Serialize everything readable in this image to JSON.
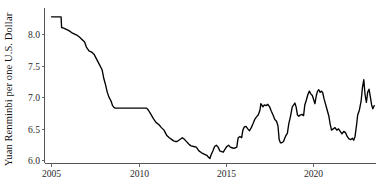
{
  "chart_data": {
    "type": "line",
    "title": "",
    "subtitle": "",
    "xlabel": "",
    "ylabel": "Yuan Renminbi per one U.S. Dollar",
    "legend": [],
    "legend_position": "none",
    "grid": false,
    "line_color": "#000000",
    "background_color": "#ffffff",
    "axis_color": "#555555",
    "xlim": [
      2004.6,
      2023.6
    ],
    "ylim": [
      5.95,
      8.42
    ],
    "xticks": [
      2005,
      2010,
      2015,
      2020
    ],
    "xticklabels": [
      "2005",
      "2010",
      "2015",
      "2020"
    ],
    "yticks": [
      6.0,
      6.5,
      7.0,
      7.5,
      8.0
    ],
    "yticklabels": [
      "6.0",
      "6.5",
      "7.0",
      "7.5",
      "8.0"
    ],
    "series": [
      {
        "name": "Yuan Renminbi per one U.S. Dollar",
        "x": [
          2005.0,
          2005.2,
          2005.4,
          2005.55,
          2005.58,
          2005.7,
          2005.85,
          2006.0,
          2006.15,
          2006.3,
          2006.45,
          2006.6,
          2006.75,
          2006.9,
          2007.0,
          2007.15,
          2007.3,
          2007.45,
          2007.6,
          2007.75,
          2007.9,
          2008.0,
          2008.1,
          2008.2,
          2008.3,
          2008.4,
          2008.5,
          2008.58,
          2008.65,
          2008.8,
          2009.0,
          2009.25,
          2009.5,
          2009.75,
          2010.0,
          2010.25,
          2010.45,
          2010.55,
          2010.7,
          2010.85,
          2011.0,
          2011.15,
          2011.3,
          2011.45,
          2011.6,
          2011.75,
          2011.9,
          2012.0,
          2012.1,
          2012.2,
          2012.3,
          2012.4,
          2012.5,
          2012.6,
          2012.7,
          2012.8,
          2012.9,
          2013.0,
          2013.15,
          2013.3,
          2013.45,
          2013.6,
          2013.75,
          2013.9,
          2014.0,
          2014.08,
          2014.15,
          2014.25,
          2014.35,
          2014.45,
          2014.55,
          2014.65,
          2014.75,
          2014.85,
          2014.95,
          2015.05,
          2015.15,
          2015.25,
          2015.35,
          2015.45,
          2015.55,
          2015.62,
          2015.7,
          2015.8,
          2015.9,
          2015.97,
          2016.05,
          2016.15,
          2016.25,
          2016.35,
          2016.45,
          2016.55,
          2016.65,
          2016.75,
          2016.85,
          2016.95,
          2017.0,
          2017.05,
          2017.12,
          2017.2,
          2017.3,
          2017.4,
          2017.5,
          2017.6,
          2017.7,
          2017.8,
          2017.9,
          2017.98,
          2018.05,
          2018.12,
          2018.2,
          2018.3,
          2018.38,
          2018.45,
          2018.52,
          2018.6,
          2018.7,
          2018.8,
          2018.88,
          2018.95,
          2019.02,
          2019.1,
          2019.18,
          2019.25,
          2019.35,
          2019.45,
          2019.52,
          2019.6,
          2019.7,
          2019.78,
          2019.85,
          2019.95,
          2020.02,
          2020.1,
          2020.18,
          2020.25,
          2020.32,
          2020.4,
          2020.48,
          2020.55,
          2020.62,
          2020.7,
          2020.8,
          2020.9,
          2020.97,
          2021.05,
          2021.15,
          2021.25,
          2021.35,
          2021.45,
          2021.55,
          2021.65,
          2021.75,
          2021.85,
          2021.95,
          2022.05,
          2022.15,
          2022.25,
          2022.32,
          2022.4,
          2022.48,
          2022.55,
          2022.65,
          2022.75,
          2022.82,
          2022.9,
          2022.97,
          2023.05,
          2023.12,
          2023.2,
          2023.28,
          2023.35,
          2023.42,
          2023.5
        ],
        "values": [
          8.28,
          8.28,
          8.28,
          8.28,
          8.11,
          8.1,
          8.08,
          8.06,
          8.03,
          8.01,
          7.99,
          7.96,
          7.92,
          7.88,
          7.8,
          7.74,
          7.72,
          7.68,
          7.6,
          7.52,
          7.44,
          7.3,
          7.2,
          7.08,
          7.0,
          6.95,
          6.87,
          6.84,
          6.83,
          6.83,
          6.83,
          6.83,
          6.83,
          6.83,
          6.83,
          6.83,
          6.83,
          6.8,
          6.73,
          6.66,
          6.6,
          6.57,
          6.52,
          6.48,
          6.4,
          6.36,
          6.33,
          6.31,
          6.3,
          6.3,
          6.32,
          6.34,
          6.36,
          6.34,
          6.31,
          6.28,
          6.25,
          6.23,
          6.22,
          6.21,
          6.15,
          6.12,
          6.1,
          6.08,
          6.05,
          6.03,
          6.09,
          6.15,
          6.22,
          6.24,
          6.21,
          6.15,
          6.14,
          6.13,
          6.18,
          6.22,
          6.24,
          6.21,
          6.2,
          6.19,
          6.2,
          6.21,
          6.36,
          6.38,
          6.36,
          6.48,
          6.53,
          6.54,
          6.5,
          6.47,
          6.52,
          6.58,
          6.65,
          6.69,
          6.72,
          6.8,
          6.9,
          6.88,
          6.85,
          6.88,
          6.87,
          6.89,
          6.85,
          6.78,
          6.72,
          6.65,
          6.62,
          6.55,
          6.33,
          6.28,
          6.28,
          6.3,
          6.36,
          6.4,
          6.43,
          6.58,
          6.7,
          6.85,
          6.88,
          6.91,
          6.85,
          6.72,
          6.7,
          6.72,
          6.73,
          6.71,
          6.88,
          6.95,
          7.05,
          7.1,
          7.06,
          7.03,
          6.97,
          6.9,
          7.03,
          7.1,
          7.12,
          7.08,
          7.1,
          7.07,
          6.98,
          6.9,
          6.8,
          6.7,
          6.58,
          6.48,
          6.5,
          6.52,
          6.48,
          6.5,
          6.46,
          6.42,
          6.46,
          6.44,
          6.38,
          6.34,
          6.33,
          6.35,
          6.32,
          6.38,
          6.55,
          6.72,
          6.8,
          6.95,
          7.15,
          7.28,
          7.05,
          6.92,
          7.08,
          7.13,
          7.0,
          6.88,
          6.82,
          6.87
        ]
      }
    ]
  },
  "axis": {
    "ylabel_text": "Yuan Renminbi per one U.S. Dollar",
    "ytick_labels": [
      "6.0",
      "6.5",
      "7.0",
      "7.5",
      "8.0"
    ],
    "xtick_labels": [
      "2005",
      "2010",
      "2015",
      "2020"
    ]
  }
}
